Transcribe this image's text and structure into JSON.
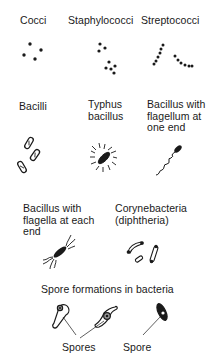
{
  "diagram": {
    "row1": {
      "cocci": "Cocci",
      "staphylococci": "Staphylococci",
      "streptococci": "Streptococci"
    },
    "row2": {
      "bacilli": "Bacilli",
      "typhus": "Typhus\nbacillus",
      "flagellum_one_end": "Bacillus with\nflagellum at\none end"
    },
    "row3": {
      "flagella_each_end": "Bacillus with\nflagella at each\nend",
      "corynebacteria": "Corynebacteria\n(diphtheria)"
    },
    "spores": {
      "heading": "Spore formations in bacteria",
      "label_plural": "Spores",
      "label_single": "Spore"
    },
    "colors": {
      "ink": "#1a1a1a",
      "background": "#ffffff"
    }
  }
}
